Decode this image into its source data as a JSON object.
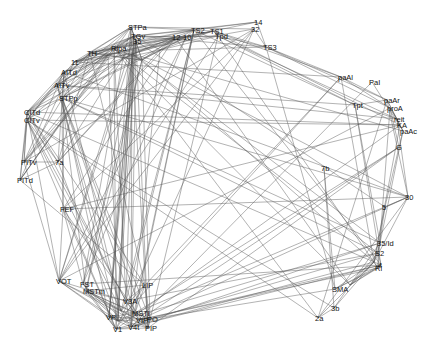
{
  "diagram": {
    "type": "network-graph",
    "edge_color": "#555555",
    "label_color": "#111111",
    "background": "#ffffff",
    "nodes": [
      {
        "id": "STPa",
        "x": 131,
        "y": 27
      },
      {
        "id": "TS2",
        "x": 194,
        "y": 30
      },
      {
        "id": "TS1",
        "x": 213,
        "y": 31
      },
      {
        "id": "32",
        "x": 254,
        "y": 29
      },
      {
        "id": "14",
        "x": 257,
        "y": 22
      },
      {
        "id": "Tpd",
        "x": 218,
        "y": 36
      },
      {
        "id": "TGv",
        "x": 134,
        "y": 36
      },
      {
        "id": "35/36",
        "x": 136,
        "y": 41
      },
      {
        "id": "12",
        "x": 175,
        "y": 37
      },
      {
        "id": "10",
        "x": 186,
        "y": 37
      },
      {
        "id": "TS3",
        "x": 266,
        "y": 47
      },
      {
        "id": "TH",
        "x": 90,
        "y": 53
      },
      {
        "id": "Ripa",
        "x": 114,
        "y": 48
      },
      {
        "id": "ER",
        "x": 108,
        "y": 55
      },
      {
        "id": "13",
        "x": 123,
        "y": 58
      },
      {
        "id": "24",
        "x": 132,
        "y": 54
      },
      {
        "id": "23",
        "x": 142,
        "y": 60
      },
      {
        "id": "9",
        "x": 160,
        "y": 50
      },
      {
        "id": "11",
        "x": 74,
        "y": 62
      },
      {
        "id": "AITd",
        "x": 64,
        "y": 72
      },
      {
        "id": "AITv",
        "x": 57,
        "y": 85
      },
      {
        "id": "STPp",
        "x": 62,
        "y": 98
      },
      {
        "id": "CITd",
        "x": 27,
        "y": 112
      },
      {
        "id": "CITv",
        "x": 27,
        "y": 120
      },
      {
        "id": "PITv",
        "x": 24,
        "y": 162
      },
      {
        "id": "PITd",
        "x": 20,
        "y": 180
      },
      {
        "id": "7a",
        "x": 58,
        "y": 162
      },
      {
        "id": "FEF",
        "x": 63,
        "y": 209
      },
      {
        "id": "paAl",
        "x": 341,
        "y": 77
      },
      {
        "id": "PaI",
        "x": 372,
        "y": 82
      },
      {
        "id": "Tpt",
        "x": 355,
        "y": 105
      },
      {
        "id": "paAr",
        "x": 387,
        "y": 100
      },
      {
        "id": "proA",
        "x": 390,
        "y": 108
      },
      {
        "id": "reit",
        "x": 397,
        "y": 119
      },
      {
        "id": "KA",
        "x": 400,
        "y": 125
      },
      {
        "id": "paAc",
        "x": 403,
        "y": 131
      },
      {
        "id": "G",
        "x": 399,
        "y": 147
      },
      {
        "id": "7b",
        "x": 324,
        "y": 168
      },
      {
        "id": "30",
        "x": 408,
        "y": 197
      },
      {
        "id": "5",
        "x": 385,
        "y": 207
      },
      {
        "id": "35/Id",
        "x": 380,
        "y": 243
      },
      {
        "id": "SII",
        "x": 378,
        "y": 253
      },
      {
        "id": "3a",
        "x": 374,
        "y": 262
      },
      {
        "id": "Ri",
        "x": 378,
        "y": 268
      },
      {
        "id": "4",
        "x": 381,
        "y": 265
      },
      {
        "id": "SMA",
        "x": 335,
        "y": 289
      },
      {
        "id": "6",
        "x": 350,
        "y": 285
      },
      {
        "id": "3b",
        "x": 334,
        "y": 308
      },
      {
        "id": "2a",
        "x": 318,
        "y": 318
      },
      {
        "id": "LIP",
        "x": 145,
        "y": 285
      },
      {
        "id": "VOT",
        "x": 59,
        "y": 281
      },
      {
        "id": "FST",
        "x": 83,
        "y": 284
      },
      {
        "id": "MSTm",
        "x": 86,
        "y": 291
      },
      {
        "id": "V3A",
        "x": 126,
        "y": 301
      },
      {
        "id": "V2",
        "x": 121,
        "y": 311
      },
      {
        "id": "MSTl",
        "x": 135,
        "y": 313
      },
      {
        "id": "VP",
        "x": 109,
        "y": 317
      },
      {
        "id": "V3",
        "x": 118,
        "y": 321
      },
      {
        "id": "VIP",
        "x": 139,
        "y": 320
      },
      {
        "id": "PO",
        "x": 150,
        "y": 319
      },
      {
        "id": "V1",
        "x": 116,
        "y": 329
      },
      {
        "id": "V4t",
        "x": 131,
        "y": 327
      },
      {
        "id": "PIP",
        "x": 148,
        "y": 328
      }
    ],
    "labels_visible": [
      "STPa",
      "TS2",
      "TS1",
      "14",
      "32",
      "Tpd",
      "TGv",
      "35",
      "12",
      "10",
      "TS3",
      "TH",
      "Ripa",
      "11",
      "AITd",
      "AITv",
      "STPp",
      "7a",
      "CITd",
      "CITv",
      "PITv",
      "PITd",
      "FEF",
      "paAl",
      "PaI",
      "Tpt",
      "paAr",
      "proA",
      "reit",
      "KA",
      "paAc",
      "G",
      "7b",
      "30",
      "5",
      "35/Id",
      "S2",
      "Ri",
      "4",
      "SMA",
      "3b",
      "2a",
      "LIP",
      "VOT",
      "FST",
      "MSTm",
      "MSTl",
      "VIP",
      "PO",
      "V1",
      "V4t",
      "PIP",
      "V3A",
      "VP"
    ]
  }
}
